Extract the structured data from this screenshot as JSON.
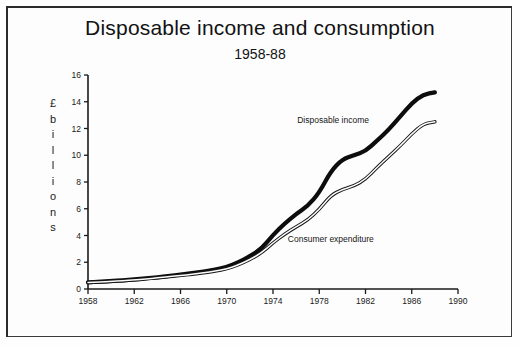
{
  "document": {
    "border_color": "#2b2b2b",
    "background_color": "#fdfdfd"
  },
  "chart_data": {
    "type": "line",
    "title": "Disposable income and consumption",
    "subtitle": "1958-88",
    "xlabel": "",
    "ylabel": "£ billions",
    "ylabel_chars": [
      "£",
      "b",
      "i",
      "l",
      "l",
      "i",
      "o",
      "n",
      "s"
    ],
    "xlim": [
      1958,
      1990
    ],
    "ylim": [
      0,
      16
    ],
    "xticks": [
      1958,
      1962,
      1966,
      1970,
      1974,
      1978,
      1982,
      1986,
      1990
    ],
    "yticks": [
      0,
      2,
      4,
      6,
      8,
      10,
      12,
      14,
      16
    ],
    "grid": false,
    "legend_position": "inline-annotations",
    "x": [
      1958,
      1959,
      1960,
      1961,
      1962,
      1963,
      1964,
      1965,
      1966,
      1967,
      1968,
      1969,
      1970,
      1971,
      1972,
      1973,
      1974,
      1975,
      1976,
      1977,
      1978,
      1979,
      1980,
      1981,
      1982,
      1983,
      1984,
      1985,
      1986,
      1987,
      1988
    ],
    "series": [
      {
        "name": "Disposable income",
        "line_style": "thick-solid",
        "color": "#0d0d0d",
        "label_x": 1979.2,
        "label_y": 12.4,
        "values": [
          0.5,
          0.55,
          0.6,
          0.65,
          0.72,
          0.8,
          0.88,
          0.98,
          1.08,
          1.18,
          1.3,
          1.45,
          1.65,
          2.0,
          2.45,
          3.0,
          4.05,
          4.9,
          5.6,
          6.2,
          7.2,
          8.8,
          9.7,
          10.0,
          10.3,
          11.1,
          11.9,
          12.9,
          13.9,
          14.55,
          14.7
        ]
      },
      {
        "name": "Consumer expenditure",
        "line_style": "thin-double",
        "color": "#151515",
        "label_x": 1979.0,
        "label_y": 3.55,
        "values": [
          0.48,
          0.52,
          0.57,
          0.62,
          0.68,
          0.75,
          0.83,
          0.92,
          1.01,
          1.1,
          1.21,
          1.34,
          1.5,
          1.8,
          2.2,
          2.7,
          3.45,
          4.1,
          4.65,
          5.15,
          5.95,
          7.0,
          7.45,
          7.7,
          8.2,
          9.1,
          9.9,
          10.7,
          11.6,
          12.35,
          12.5
        ]
      }
    ]
  },
  "axis_geometry": {
    "x_origin_px": 88,
    "x_end_px": 458,
    "y_zero_px": 289,
    "y_top_px": 75
  }
}
